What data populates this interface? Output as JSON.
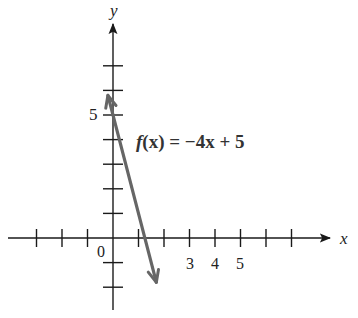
{
  "chart_data": {
    "type": "line",
    "title": "",
    "xlabel": "x",
    "ylabel": "y",
    "function_label": "f(x) = −4x + 5",
    "series": [
      {
        "name": "f(x) = −4x + 5",
        "slope": -4,
        "intercept": 5,
        "x": [
          -0.2,
          1.7
        ],
        "y": [
          5.8,
          -1.8
        ]
      }
    ],
    "x_ticks": [
      -3,
      -2,
      -1,
      1,
      2,
      3,
      4,
      5,
      6,
      7
    ],
    "x_tick_labels": {
      "0": "0",
      "3": "3",
      "4": "4",
      "5": "5"
    },
    "y_ticks": [
      -2,
      -1,
      1,
      2,
      3,
      4,
      5,
      6,
      7
    ],
    "y_tick_labels": {
      "5": "5"
    },
    "xlim": [
      -4.2,
      8.5
    ],
    "ylim": [
      -3.2,
      8.5
    ],
    "grid": false,
    "legend": "none",
    "colors": {
      "axes": "#1a1a1a",
      "line": "#666666"
    }
  },
  "labels": {
    "x_axis": "x",
    "y_axis": "y",
    "origin": "0",
    "y5": "5",
    "x3": "3",
    "x4": "4",
    "x5": "5",
    "func_f": "f",
    "func_rest": "(x) = −4x + 5"
  }
}
